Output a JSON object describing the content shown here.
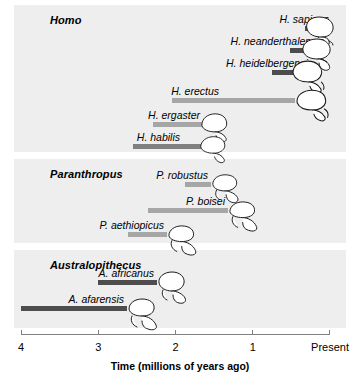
{
  "figure": {
    "axis_title": "Time (millions of years ago)",
    "axis_ticks": [
      {
        "label": "4",
        "value": 4
      },
      {
        "label": "3",
        "value": 3
      },
      {
        "label": "2",
        "value": 2
      },
      {
        "label": "1",
        "value": 1
      },
      {
        "label": "Present",
        "value": 0
      }
    ]
  },
  "genera": [
    {
      "key": "homo",
      "label": "Homo"
    },
    {
      "key": "paranthropus",
      "label": "Paranthropus"
    },
    {
      "key": "australopithecus",
      "label": "Australopithecus"
    }
  ],
  "species": [
    {
      "key": "h-sapiens",
      "label": "H. sapiens",
      "genus": "Homo"
    },
    {
      "key": "h-neanderthalensis",
      "label": "H. neanderthalensis",
      "genus": "Homo"
    },
    {
      "key": "h-heidelbergensis",
      "label": "H. heidelbergensis",
      "genus": "Homo"
    },
    {
      "key": "h-erectus",
      "label": "H. erectus",
      "genus": "Homo"
    },
    {
      "key": "h-ergaster",
      "label": "H. ergaster",
      "genus": "Homo"
    },
    {
      "key": "h-habilis",
      "label": "H. habilis",
      "genus": "Homo"
    },
    {
      "key": "p-robustus",
      "label": "P. robustus",
      "genus": "Paranthropus"
    },
    {
      "key": "p-boisei",
      "label": "P. boisei",
      "genus": "Paranthropus"
    },
    {
      "key": "p-aethiopicus",
      "label": "P. aethiopicus",
      "genus": "Paranthropus"
    },
    {
      "key": "a-africanus",
      "label": "A. africanus",
      "genus": "Australopithecus"
    },
    {
      "key": "a-afarensis",
      "label": "A. afarensis",
      "genus": "Australopithecus"
    }
  ],
  "colors": {
    "panel_background": "#eeeeee",
    "bar_dark": "#4d4d4d",
    "bar_medium": "#808080",
    "bar_light": "#a6a6a6",
    "axis_line": "#808080",
    "text": "#000000",
    "page_background": "#ffffff"
  },
  "chart_data": {
    "type": "bar",
    "orientation": "horizontal",
    "title": "",
    "xlabel": "Time (millions of years ago)",
    "ylabel": "",
    "xlim": [
      4.0,
      0.0
    ],
    "x_axis_reversed": true,
    "xticks": [
      4,
      3,
      2,
      1,
      0
    ],
    "xticklabels": [
      "4",
      "3",
      "2",
      "1",
      "Present"
    ],
    "grid": false,
    "legend": "none",
    "units": "millions of years ago",
    "note": "Each bar is a temporal range (start = older, end = younger) for a hominin species; skull drawing shown at the young end of each range.",
    "categories": [
      "H. sapiens",
      "H. neanderthalensis",
      "H. heidelbergensis",
      "H. erectus",
      "H. ergaster",
      "H. habilis",
      "P. robustus",
      "P. boisei",
      "P. aethiopicus",
      "A. africanus",
      "A. afarensis"
    ],
    "ranges": [
      {
        "category": "H. sapiens",
        "genus": "Homo",
        "start_mya": 0.32,
        "end_mya": 0.06,
        "shade": "dark"
      },
      {
        "category": "H. neanderthalensis",
        "genus": "Homo",
        "start_mya": 0.52,
        "end_mya": 0.13,
        "shade": "dark"
      },
      {
        "category": "H. heidelbergensis",
        "genus": "Homo",
        "start_mya": 0.75,
        "end_mya": 0.26,
        "shade": "dark"
      },
      {
        "category": "H. erectus",
        "genus": "Homo",
        "start_mya": 2.05,
        "end_mya": 0.45,
        "shade": "light"
      },
      {
        "category": "H. ergaster",
        "genus": "Homo",
        "start_mya": 2.29,
        "end_mya": 1.64,
        "shade": "light"
      },
      {
        "category": "H. habilis",
        "genus": "Homo",
        "start_mya": 2.55,
        "end_mya": 1.64,
        "shade": "medium"
      },
      {
        "category": "P. robustus",
        "genus": "Paranthropus",
        "start_mya": 1.88,
        "end_mya": 1.54,
        "shade": "light"
      },
      {
        "category": "P. boisei",
        "genus": "Paranthropus",
        "start_mya": 2.36,
        "end_mya": 1.32,
        "shade": "light"
      },
      {
        "category": "P. aethiopicus",
        "genus": "Paranthropus",
        "start_mya": 2.62,
        "end_mya": 2.11,
        "shade": "light"
      },
      {
        "category": "A. africanus",
        "genus": "Australopithecus",
        "start_mya": 3.0,
        "end_mya": 2.24,
        "shade": "dark"
      },
      {
        "category": "A. afarensis",
        "genus": "Australopithecus",
        "start_mya": 4.0,
        "end_mya": 2.63,
        "shade": "dark"
      }
    ]
  },
  "layout": {
    "rows": [
      {
        "key": "h-sapiens",
        "row_top": 14,
        "label_right_px": 329,
        "skull_left": 303,
        "skull_scale": 1.0,
        "skull_type": "sapiens"
      },
      {
        "key": "h-neanderthalensis",
        "row_top": 36,
        "label_right_px": 324,
        "skull_left": 300,
        "skull_scale": 1.0,
        "skull_type": "neanderthal"
      },
      {
        "key": "h-heidelbergensis",
        "row_top": 58,
        "label_right_px": 313,
        "skull_left": 290,
        "skull_scale": 1.05,
        "skull_type": "heidelberg"
      },
      {
        "key": "h-erectus",
        "row_top": 86,
        "label_right_px": 219,
        "skull_left": 294,
        "skull_scale": 1.05,
        "skull_type": "erectus"
      },
      {
        "key": "h-ergaster",
        "row_top": 110,
        "label_right_px": 200,
        "skull_left": 199,
        "skull_scale": 0.95,
        "skull_type": "ergaster"
      },
      {
        "key": "h-habilis",
        "row_top": 132,
        "label_right_px": 180,
        "skull_left": 198,
        "skull_scale": 0.92,
        "skull_type": "habilis"
      },
      {
        "key": "p-robustus",
        "row_top": 170,
        "label_right_px": 208,
        "skull_left": 209,
        "skull_scale": 0.95,
        "skull_type": "robustus"
      },
      {
        "key": "p-boisei",
        "row_top": 196,
        "label_right_px": 225,
        "skull_left": 226,
        "skull_scale": 0.98,
        "skull_type": "boisei"
      },
      {
        "key": "p-aethiopicus",
        "row_top": 220,
        "label_right_px": 164,
        "skull_left": 165,
        "skull_scale": 0.98,
        "skull_type": "aethiopicus"
      },
      {
        "key": "a-africanus",
        "row_top": 268,
        "label_right_px": 154,
        "skull_left": 155,
        "skull_scale": 1.0,
        "skull_type": "africanus"
      },
      {
        "key": "a-afarensis",
        "row_top": 294,
        "label_right_px": 124,
        "skull_left": 125,
        "skull_scale": 1.0,
        "skull_type": "afarensis"
      }
    ],
    "axis_y": 334,
    "axis_x_left": 21,
    "axis_x_right": 330
  }
}
